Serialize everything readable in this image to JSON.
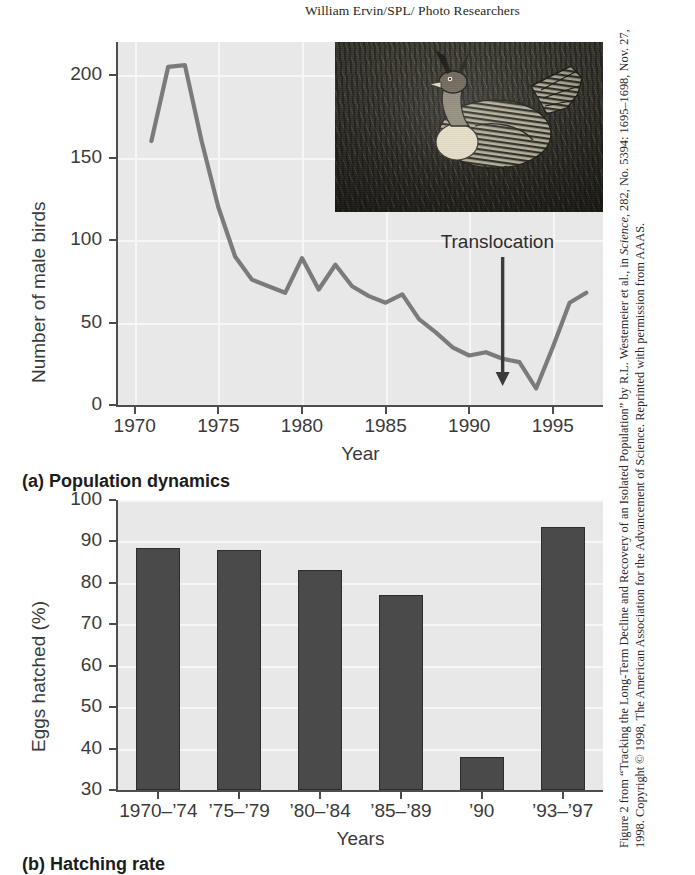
{
  "photo_credit": "William Ervin/SPL/ Photo Researchers",
  "source_caption": {
    "part1": "Figure 2 from “Tracking the Long-Term Decline and Recovery of an Isolated Population” by R.L. Westemeier et al., in ",
    "italic1": "Science",
    "part2": ", 282, No. 5394: 1695–1698, Nov. 27, 1998. Copyright © 1998, The American Association for the Advancement of Science. Reprinted with permission from AAAS."
  },
  "panel_a": {
    "caption": "(a) Population dynamics",
    "annotation": "Translocation",
    "photo_alt_name": "greater-prairie-chicken-photo"
  },
  "panel_b": {
    "caption": "(b) Hatching rate"
  },
  "chart_data": [
    {
      "id": "population-dynamics",
      "type": "line",
      "title": "(a) Population dynamics",
      "xlabel": "Year",
      "ylabel": "Number of male birds",
      "xlim": [
        1969.0,
        1998.0
      ],
      "ylim": [
        0,
        220
      ],
      "yticks": [
        0,
        50,
        100,
        150,
        200
      ],
      "xticks": [
        1970,
        1975,
        1980,
        1985,
        1990,
        1995
      ],
      "grid": true,
      "annotations": [
        {
          "text": "Translocation",
          "x": 1992,
          "y": 14,
          "arrow": true
        }
      ],
      "x": [
        1971,
        1972,
        1973,
        1974,
        1975,
        1976,
        1977,
        1978,
        1979,
        1980,
        1981,
        1982,
        1983,
        1984,
        1985,
        1986,
        1987,
        1988,
        1989,
        1990,
        1991,
        1992,
        1993,
        1994,
        1995,
        1996,
        1997
      ],
      "values": [
        160,
        205,
        206,
        160,
        120,
        90,
        76,
        72,
        68,
        89,
        70,
        85,
        72,
        66,
        62,
        67,
        52,
        44,
        35,
        30,
        32,
        28,
        26,
        10,
        35,
        62,
        68
      ],
      "y_values_label": "Number of male birds"
    },
    {
      "id": "hatching-rate",
      "type": "bar",
      "title": "(b) Hatching rate",
      "xlabel": "Years",
      "ylabel": "Eggs hatched (%)",
      "ylim": [
        30,
        100
      ],
      "yticks": [
        30,
        40,
        50,
        60,
        70,
        80,
        90,
        100
      ],
      "grid": true,
      "categories": [
        "1970–’74",
        "’75–’79",
        "’80–’84",
        "’85–’89",
        "’90",
        "’93–’97"
      ],
      "values": [
        88.5,
        88,
        83,
        77,
        38,
        93.5
      ]
    }
  ],
  "colors": {
    "plot_background": "#e8e8e8",
    "gridline": "#f6f6f6",
    "axis": "#4d4d4d",
    "line_series": "#7b7b7b",
    "bar_fill": "#4a4a4a",
    "text": "#3a3a3a"
  }
}
